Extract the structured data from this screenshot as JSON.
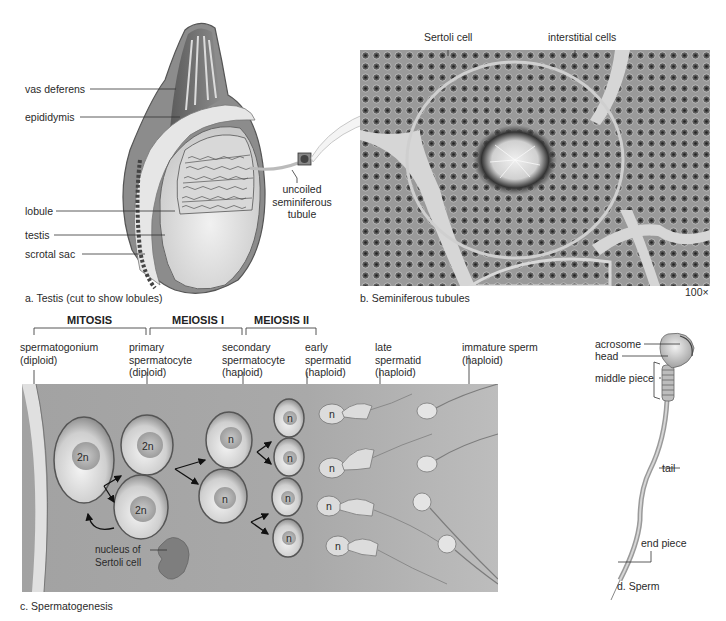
{
  "panel_a": {
    "caption": "a. Testis (cut to show lobules)",
    "labels": {
      "vas_deferens": "vas deferens",
      "epididymis": "epididymis",
      "lobule": "lobule",
      "testis": "testis",
      "scrotal_sac": "scrotal sac",
      "uncoiled_line1": "uncoiled",
      "uncoiled_line2": "seminiferous",
      "uncoiled_line3": "tubule"
    }
  },
  "panel_b": {
    "caption": "b. Seminiferous tubules",
    "magnification": "100×",
    "labels": {
      "sertoli_cell": "Sertoli cell",
      "interstitial_cells": "interstitial cells"
    }
  },
  "panel_c": {
    "caption": "c. Spermatogenesis",
    "phases": {
      "mitosis": "MITOSIS",
      "meiosis1": "MEIOSIS I",
      "meiosis2": "MEIOSIS II"
    },
    "stages": [
      {
        "name": "spermatogonium",
        "ploidy": "(diploid)"
      },
      {
        "name_line1": "primary",
        "name_line2": "spermatocyte",
        "ploidy": "(diploid)"
      },
      {
        "name_line1": "secondary",
        "name_line2": "spermatocyte",
        "ploidy": "(haploid)"
      },
      {
        "name_line1": "early",
        "name_line2": "spermatid",
        "ploidy": "(haploid)"
      },
      {
        "name_line1": "late",
        "name_line2": "spermatid",
        "ploidy": "(haploid)"
      },
      {
        "name": "immature sperm",
        "ploidy": "(haploid)"
      }
    ],
    "cell_labels": {
      "diploid": "2n",
      "haploid": "n"
    },
    "sertoli_nucleus_line1": "nucleus of",
    "sertoli_nucleus_line2": "Sertoli cell"
  },
  "panel_d": {
    "caption": "d. Sperm",
    "labels": {
      "acrosome": "acrosome",
      "head": "head",
      "middle_piece": "middle piece",
      "tail": "tail",
      "end_piece": "end piece"
    }
  }
}
